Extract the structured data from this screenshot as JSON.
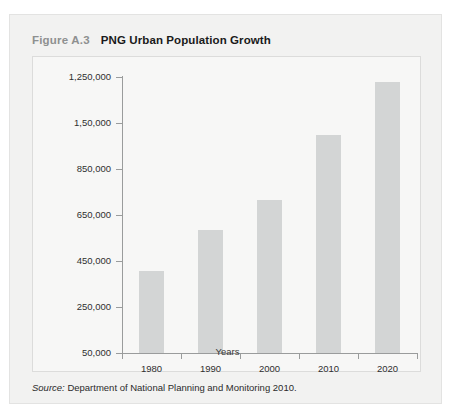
{
  "figure": {
    "number_label": "Figure A.3",
    "title": "PNG Urban Population Growth",
    "source_label": "Source:",
    "source_text": " Department of National Planning and Monitoring 2010."
  },
  "colors": {
    "card_background": "#f2f2f1",
    "plot_background": "#f7f7f6",
    "bar_fill": "#d3d5d5",
    "axis": "#9a9c9c",
    "title_figno": "#8e9090",
    "title_main": "#1a1a1a"
  },
  "chart_data": {
    "type": "bar",
    "title": "PNG Urban Population Growth",
    "xlabel": "Years",
    "ylabel": "Population",
    "categories": [
      "1980",
      "1990",
      "2000",
      "2010",
      "2020"
    ],
    "values": [
      405000,
      585000,
      715000,
      1000000,
      1230000
    ],
    "ylim": [
      50000,
      1250000
    ],
    "ytick_values": [
      50000,
      250000,
      450000,
      650000,
      850000,
      1050000,
      1250000
    ],
    "ytick_labels": [
      "50,000",
      "250,000",
      "450,000",
      "650,000",
      "850,000",
      "1,50,000",
      "1,250,000"
    ],
    "grid": false,
    "legend": false
  }
}
